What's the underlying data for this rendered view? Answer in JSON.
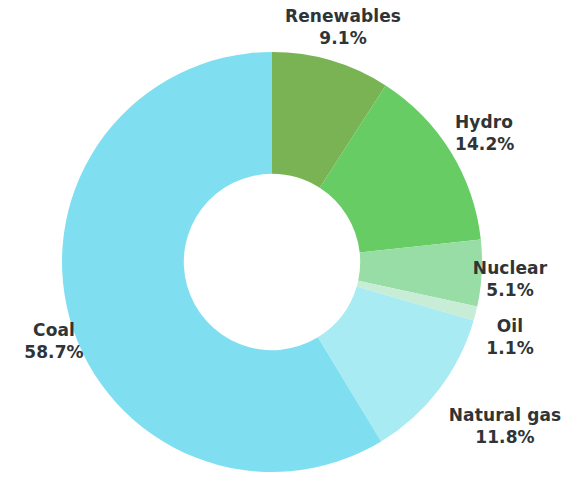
{
  "chart_data": {
    "type": "pie",
    "variant": "donut",
    "title": "",
    "subtitle": "",
    "xlabel": "",
    "ylabel": "",
    "legend_position": "none",
    "grid": false,
    "value_unit": "%",
    "total": 100.0,
    "start_angle_deg": 0,
    "direction": "clockwise",
    "inner_radius_ratio": 0.42,
    "categories": [
      "Renewables",
      "Hydro",
      "Nuclear",
      "Oil",
      "Natural gas",
      "Coal"
    ],
    "values": [
      9.1,
      14.2,
      5.1,
      1.1,
      11.8,
      58.7
    ],
    "labels": [
      "9.1%",
      "14.2%",
      "5.1%",
      "1.1%",
      "11.8%",
      "58.7%"
    ],
    "colors": [
      "#79b354",
      "#68cc64",
      "#97dda5",
      "#c7edd6",
      "#a8ebf3",
      "#7fdff0"
    ],
    "slices": [
      {
        "name": "Renewables",
        "value": 9.1,
        "label": "9.1%",
        "color": "#79b354"
      },
      {
        "name": "Hydro",
        "value": 14.2,
        "label": "14.2%",
        "color": "#68cc64"
      },
      {
        "name": "Nuclear",
        "value": 5.1,
        "label": "5.1%",
        "color": "#97dda5"
      },
      {
        "name": "Oil",
        "value": 1.1,
        "label": "1.1%",
        "color": "#c7edd6"
      },
      {
        "name": "Natural gas",
        "value": 11.8,
        "label": "11.8%",
        "color": "#a8ebf3"
      },
      {
        "name": "Coal",
        "value": 58.7,
        "label": "58.7%",
        "color": "#7fdff0"
      }
    ]
  },
  "labels": {
    "renewables": {
      "name": "Renewables",
      "value": "9.1%"
    },
    "hydro": {
      "name": "Hydro",
      "value": "14.2%"
    },
    "nuclear": {
      "name": "Nuclear",
      "value": "5.1%"
    },
    "oil": {
      "name": "Oil",
      "value": "1.1%"
    },
    "natural_gas": {
      "name": "Natural gas",
      "value": "11.8%"
    },
    "coal": {
      "name": "Coal",
      "value": "58.7%"
    }
  },
  "style": {
    "background": "#ffffff",
    "label_color": "#2f3436"
  }
}
